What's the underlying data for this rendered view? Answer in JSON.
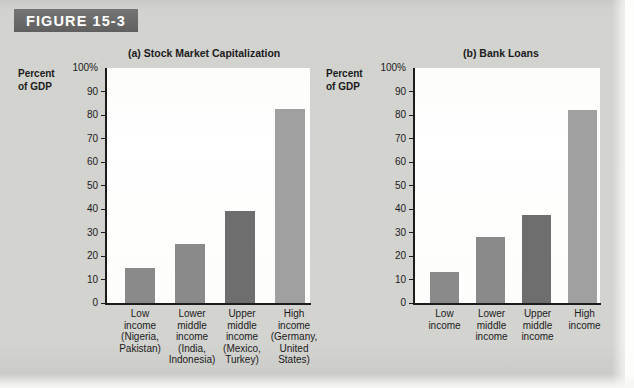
{
  "figure": {
    "label": "FIGURE 15-3",
    "banner_color": "#6d6d6d"
  },
  "page": {
    "background_color": "#d2d2ce",
    "plot_background_color": "#fdfdfb"
  },
  "axis": {
    "caption_line1": "Percent",
    "caption_line2": "of GDP",
    "tick_labels": [
      "100%",
      "90",
      "80",
      "70",
      "60",
      "50",
      "40",
      "30",
      "20",
      "10",
      "0"
    ]
  },
  "colors": {
    "bar_medium": "#8a8a8a",
    "bar_dark": "#6e6e6e",
    "bar_light": "#a0a0a0",
    "axis": "#1c1c1c",
    "text": "#1b1b1b"
  },
  "chart_data": [
    {
      "type": "bar",
      "title": "(a) Stock Market Capitalization",
      "xlabel": "",
      "ylabel": "Percent of GDP",
      "ylim": [
        0,
        100
      ],
      "ytick_values": [
        0,
        10,
        20,
        30,
        40,
        50,
        60,
        70,
        80,
        90,
        100
      ],
      "grid": false,
      "legend": "none",
      "categories": [
        "Low\nincome\n(Nigeria,\nPakistan)",
        "Lower\nmiddle\nincome\n(India,\nIndonesia)",
        "Upper\nmiddle\nincome\n(Mexico,\nTurkey)",
        "High\nincome\n(Germany,\nUnited\nStates)"
      ],
      "category_short": [
        "Low income",
        "Lower middle income",
        "Upper middle income",
        "High income"
      ],
      "values": [
        15,
        25,
        39,
        82.5
      ],
      "bar_colors": [
        "#8a8a8a",
        "#8a8a8a",
        "#6e6e6e",
        "#a0a0a0"
      ]
    },
    {
      "type": "bar",
      "title": "(b) Bank Loans",
      "xlabel": "",
      "ylabel": "Percent of GDP",
      "ylim": [
        0,
        100
      ],
      "ytick_values": [
        0,
        10,
        20,
        30,
        40,
        50,
        60,
        70,
        80,
        90,
        100
      ],
      "grid": false,
      "legend": "none",
      "categories": [
        "Low\nincome",
        "Lower\nmiddle\nincome",
        "Upper\nmiddle\nincome",
        "High\nincome"
      ],
      "category_short": [
        "Low income",
        "Lower middle income",
        "Upper middle income",
        "High income"
      ],
      "values": [
        13,
        28,
        37.5,
        82
      ],
      "bar_colors": [
        "#8a8a8a",
        "#8a8a8a",
        "#6e6e6e",
        "#a0a0a0"
      ]
    }
  ]
}
